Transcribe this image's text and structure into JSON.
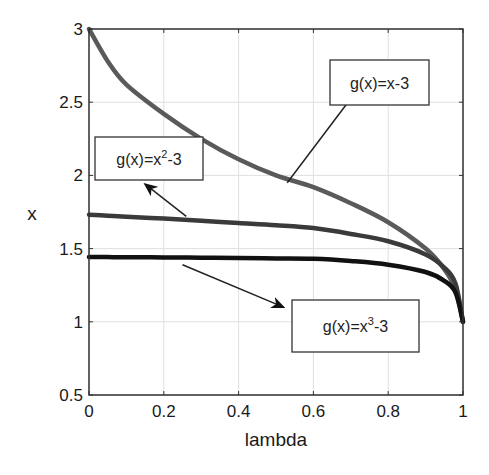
{
  "chart_data": {
    "type": "line",
    "title": "",
    "xlabel": "lambda",
    "ylabel": "x",
    "xlim": [
      0,
      1
    ],
    "ylim": [
      0.5,
      3
    ],
    "xticks": [
      0,
      0.2,
      0.4,
      0.6,
      0.8,
      1
    ],
    "xtick_labels": [
      "0",
      "0.2",
      "0.4",
      "0.6",
      "0.8",
      "1"
    ],
    "yticks": [
      0.5,
      1,
      1.5,
      2,
      2.5,
      3
    ],
    "ytick_labels": [
      "0.5",
      "1",
      "1.5",
      "2",
      "2.5",
      "3"
    ],
    "grid": true,
    "legend": null,
    "x": [
      0,
      0.05,
      0.1,
      0.2,
      0.3,
      0.4,
      0.5,
      0.6,
      0.7,
      0.8,
      0.9,
      0.95,
      0.98,
      1.0
    ],
    "series": [
      {
        "name": "g(x)=x-3",
        "color": "#5a5a5a",
        "values": [
          3.0,
          2.78,
          2.62,
          2.42,
          2.25,
          2.11,
          2.0,
          1.92,
          1.81,
          1.68,
          1.5,
          1.36,
          1.22,
          1.0
        ]
      },
      {
        "name": "g(x)=x^2-3",
        "color": "#3a3a3a",
        "values": [
          1.732,
          1.725,
          1.718,
          1.705,
          1.69,
          1.675,
          1.66,
          1.64,
          1.6,
          1.55,
          1.46,
          1.37,
          1.26,
          1.0
        ]
      },
      {
        "name": "g(x)=x^3-3",
        "color": "#111111",
        "values": [
          1.442,
          1.442,
          1.441,
          1.44,
          1.438,
          1.436,
          1.433,
          1.43,
          1.415,
          1.39,
          1.34,
          1.28,
          1.2,
          1.0
        ]
      }
    ],
    "annotations": [
      {
        "text_base": "g(x)=x",
        "sup": "",
        "tail": "-3",
        "label": "g(x)=x-3",
        "box": [
          330,
          60,
          99,
          45
        ],
        "arrow_from": [
          0.53,
          1.95
        ],
        "arrow_to": [
          0.74,
          2.66
        ]
      },
      {
        "text_base": "g(x)=x",
        "sup": "2",
        "tail": "-3",
        "label": "g(x)=x²-3",
        "box": [
          95,
          137,
          108,
          43
        ],
        "arrow_from": [
          0.26,
          1.72
        ],
        "arrow_to": [
          0.15,
          1.94
        ]
      },
      {
        "text_base": "g(x)=x",
        "sup": "3",
        "tail": "-3",
        "label": "g(x)=x³-3",
        "box": [
          292,
          300,
          127,
          52
        ],
        "arrow_from": [
          0.25,
          1.39
        ],
        "arrow_to": [
          0.52,
          1.1
        ]
      }
    ]
  }
}
